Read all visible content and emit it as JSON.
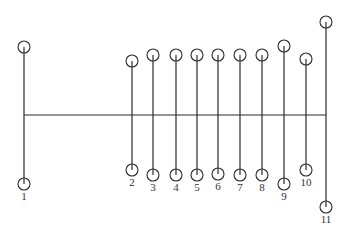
{
  "diagram": {
    "type": "stick-node diagram",
    "colors": {
      "stroke": "#2b2b2b",
      "label": "#333333",
      "background": "#ffffff"
    },
    "trunk": {
      "y": 115,
      "x_start": 24,
      "x_end": 326
    },
    "circle_radius": 6,
    "posts": [
      {
        "label": "1",
        "x": 24,
        "top_y": 47,
        "bottom_y": 184,
        "label_y": 200
      },
      {
        "label": "2",
        "x": 132,
        "top_y": 61,
        "bottom_y": 170,
        "label_y": 186
      },
      {
        "label": "3",
        "x": 153,
        "top_y": 55,
        "bottom_y": 175,
        "label_y": 191
      },
      {
        "label": "4",
        "x": 176,
        "top_y": 55,
        "bottom_y": 175,
        "label_y": 191
      },
      {
        "label": "5",
        "x": 197,
        "top_y": 55,
        "bottom_y": 175,
        "label_y": 191
      },
      {
        "label": "6",
        "x": 218,
        "top_y": 55,
        "bottom_y": 174,
        "label_y": 190
      },
      {
        "label": "7",
        "x": 240,
        "top_y": 55,
        "bottom_y": 175,
        "label_y": 191
      },
      {
        "label": "8",
        "x": 262,
        "top_y": 55,
        "bottom_y": 175,
        "label_y": 191
      },
      {
        "label": "9",
        "x": 284,
        "top_y": 46,
        "bottom_y": 184,
        "label_y": 200
      },
      {
        "label": "10",
        "x": 306,
        "top_y": 59,
        "bottom_y": 170,
        "label_y": 186
      },
      {
        "label": "11",
        "x": 326,
        "top_y": 22,
        "bottom_y": 207,
        "label_y": 223
      }
    ]
  }
}
